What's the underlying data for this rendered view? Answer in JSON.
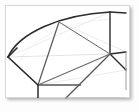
{
  "document": {
    "title": "Geometric Sector Diagram",
    "kind": "line-drawing-thumbnail",
    "alt_text": "Fan-shaped geometric construction with an arc, radial spokes and polygonal panels"
  },
  "canvas": {
    "background_color": "#ffffff",
    "page_background_color": "#fdfdfd",
    "border_color": "#d8d8d8",
    "shadow_color": "rgba(0,0,0,0.28)",
    "x": 5,
    "y": 5,
    "width": 125,
    "height": 93
  },
  "style": {
    "stroke_dark": "#2b2b2b",
    "stroke_mid": "#555555",
    "stroke_light": "#c9c9c9",
    "stroke_faint": "#e2e2e2",
    "stroke_width_heavy": 1.6,
    "stroke_width_normal": 1.2,
    "stroke_width_light": 0.8
  },
  "geometry": {
    "hub": {
      "label": "hub",
      "x": 110,
      "y": 54
    },
    "arc": {
      "label": "outer-arc",
      "start": {
        "x": 8,
        "y": 57
      },
      "end": {
        "x": 126,
        "y": 13
      },
      "radius_x": 118,
      "radius_y": 58,
      "sweep": 1,
      "color": "#2b2b2b"
    },
    "points": [
      {
        "name": "left-vertex",
        "x": 8,
        "y": 57
      },
      {
        "name": "arc-node-upper",
        "x": 59,
        "y": 22
      },
      {
        "name": "arc-node-right",
        "x": 110,
        "y": 12
      },
      {
        "name": "arc-end-right",
        "x": 126,
        "y": 13
      },
      {
        "name": "lower-left-corner",
        "x": 38,
        "y": 85
      },
      {
        "name": "lower-bottom",
        "x": 38,
        "y": 98
      },
      {
        "name": "mid-panel-corner",
        "x": 81,
        "y": 85
      },
      {
        "name": "bottom-diagonal-end",
        "x": 66,
        "y": 98
      },
      {
        "name": "right-lower",
        "x": 126,
        "y": 70
      },
      {
        "name": "right-mid",
        "x": 126,
        "y": 52
      },
      {
        "name": "right-edge-node",
        "x": 126,
        "y": 88
      }
    ],
    "spokes": [
      {
        "name": "spoke-to-left-vertex",
        "from": "hub",
        "to": "left-vertex",
        "color": "#555555"
      },
      {
        "name": "spoke-to-arc-node-upper",
        "from": "hub",
        "to": "arc-node-upper",
        "color": "#555555"
      },
      {
        "name": "spoke-to-arc-node-right",
        "from": "hub",
        "to": "arc-node-right",
        "color": "#2b2b2b"
      },
      {
        "name": "spoke-to-right-mid",
        "from": "hub",
        "to": "right-mid",
        "color": "#2b2b2b"
      },
      {
        "name": "spoke-to-right-lower",
        "from": "hub",
        "to": "right-lower",
        "color": "#2b2b2b"
      },
      {
        "name": "spoke-to-bottom-diagonal",
        "from": "hub",
        "to": "bottom-diagonal-end",
        "color": "#2b2b2b"
      },
      {
        "name": "spoke-to-lower-left-corner",
        "from": "hub",
        "to": "lower-left-corner",
        "color": "#555555"
      }
    ],
    "segments": [
      {
        "name": "chord-left-lower",
        "from": "left-vertex",
        "to": "lower-left-corner",
        "color": "#2b2b2b"
      },
      {
        "name": "panel-base-horizontal",
        "from": "lower-left-corner",
        "to": "mid-panel-corner",
        "color": "#555555"
      },
      {
        "name": "panel-drop-vertical",
        "from": "lower-left-corner",
        "to": "lower-bottom",
        "color": "#2b2b2b"
      },
      {
        "name": "radial-vertical-top",
        "from": "arc-node-right",
        "to": "hub",
        "color": "#2b2b2b"
      },
      {
        "name": "arc-tail-right",
        "from": "arc-node-right",
        "to": "arc-end-right",
        "color": "#2b2b2b"
      }
    ],
    "faint_guides": [
      {
        "name": "guide-arc-inner",
        "from": "left-vertex",
        "to": "arc-node-right",
        "color": "#e2e2e2"
      },
      {
        "name": "guide-chord-upper",
        "from": "arc-node-upper",
        "to": "right-mid",
        "color": "#e2e2e2"
      },
      {
        "name": "guide-chord-lower",
        "from": "lower-left-corner",
        "to": "right-lower",
        "color": "#e2e2e2"
      }
    ]
  }
}
